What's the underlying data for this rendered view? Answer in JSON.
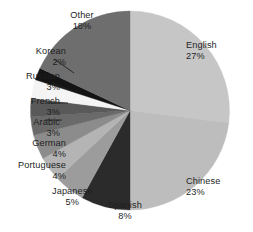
{
  "chart_data": {
    "type": "pie",
    "title": "",
    "subtitle": "",
    "xlabel": "",
    "ylabel": "",
    "legend_position": "labels-outside-with-leader-lines",
    "grid": false,
    "start_angle_deg": 0,
    "direction": "clockwise",
    "categories": [
      "English",
      "Chinese",
      "Spanish",
      "Japanese",
      "Portuguese",
      "German",
      "Arabic",
      "French",
      "Russian",
      "Korean",
      "Other"
    ],
    "values": [
      27,
      23,
      8,
      5,
      4,
      4,
      3,
      3,
      3,
      2,
      18
    ],
    "value_unit": "%",
    "slices": [
      {
        "label": "English",
        "value": 27,
        "value_text": "27%",
        "color": "#c6c6c6"
      },
      {
        "label": "Chinese",
        "value": 23,
        "value_text": "23%",
        "color": "#bdbdbd"
      },
      {
        "label": "Spanish",
        "value": 8,
        "value_text": "8%",
        "color": "#2b2b2b"
      },
      {
        "label": "Japanese",
        "value": 5,
        "value_text": "5%",
        "color": "#9c9c9c"
      },
      {
        "label": "Portuguese",
        "value": 4,
        "value_text": "4%",
        "color": "#b4b4b4"
      },
      {
        "label": "German",
        "value": 4,
        "value_text": "4%",
        "color": "#8c8c8c"
      },
      {
        "label": "Arabic",
        "value": 3,
        "value_text": "3%",
        "color": "#6a6a6a"
      },
      {
        "label": "French",
        "value": 3,
        "value_text": "3%",
        "color": "#595959"
      },
      {
        "label": "Russian",
        "value": 3,
        "value_text": "3%",
        "color": "#f4f4f4"
      },
      {
        "label": "Korean",
        "value": 2,
        "value_text": "2%",
        "color": "#141414"
      },
      {
        "label": "Other",
        "value": 18,
        "value_text": "18%",
        "color": "#6e6e6e"
      }
    ]
  },
  "labels": {
    "english": {
      "name": "English",
      "pct": "27%"
    },
    "chinese": {
      "name": "Chinese",
      "pct": "23%"
    },
    "spanish": {
      "name": "Spanish",
      "pct": "8%"
    },
    "japanese": {
      "name": "Japanese",
      "pct": "5%"
    },
    "portuguese": {
      "name": "Portuguese",
      "pct": "4%"
    },
    "german": {
      "name": "German",
      "pct": "4%"
    },
    "arabic": {
      "name": "Arabic",
      "pct": "3%"
    },
    "french": {
      "name": "French",
      "pct": "3%"
    },
    "russian": {
      "name": "Russian",
      "pct": "3%"
    },
    "korean": {
      "name": "Korean",
      "pct": "2%"
    },
    "other": {
      "name": "Other",
      "pct": "18%"
    }
  },
  "colors": {
    "background": "#ffffff",
    "text": "#1f1f1f",
    "leader_line": "#1f1f1f"
  }
}
